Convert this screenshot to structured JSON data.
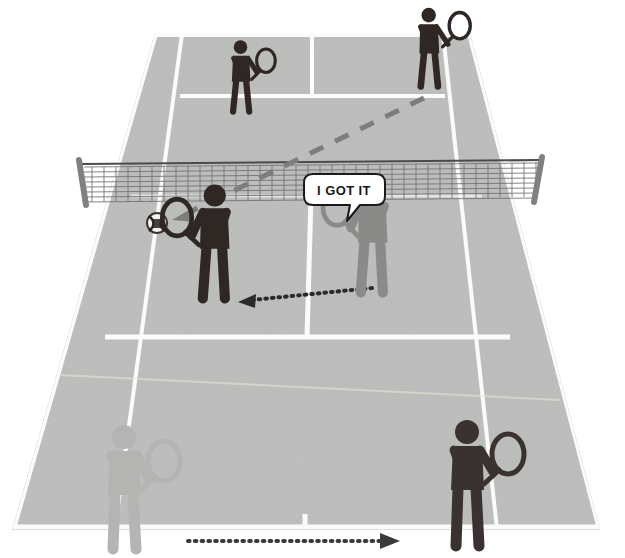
{
  "diagram": {
    "surface_color": "#c0c2c0",
    "line_color": "#fdfdfd",
    "net_color": "#6e6e6e",
    "dark_player_color": "#2e2724",
    "gray_player_color": "#8a8a88",
    "faded_player_color": "#b4b5b2",
    "arrow_dark_color": "#2b2b2b",
    "arrow_gray_color": "#7d7d7b",
    "ball_color": "#241f1d"
  },
  "callout": {
    "text": "I GOT IT",
    "speaker": "near-right-gray-player",
    "bubble_fill": "#ffffff",
    "bubble_stroke": "#1a1a1a"
  },
  "players": [
    {
      "id": "far-left-player",
      "label": "Far court left player",
      "side": "far",
      "shade": "dark",
      "color": "#2e2724",
      "x": 243,
      "y": 88,
      "scale": 0.62,
      "racket_side": "right"
    },
    {
      "id": "far-right-player",
      "label": "Far court right player (hitter)",
      "side": "far",
      "shade": "dark",
      "color": "#2e2724",
      "x": 432,
      "y": 60,
      "scale": 0.66,
      "racket_side": "right"
    },
    {
      "id": "near-left-player",
      "label": "Near court left player",
      "side": "near",
      "shade": "dark",
      "color": "#2e2724",
      "x": 212,
      "y": 258,
      "scale": 0.92,
      "racket_side": "left"
    },
    {
      "id": "near-right-player",
      "label": "Near court right player (calling)",
      "side": "near",
      "shade": "gray",
      "color": "#8a8a88",
      "x": 370,
      "y": 252,
      "scale": 0.92,
      "racket_side": "left"
    },
    {
      "id": "bottom-left-player",
      "label": "Bottom left faded player",
      "side": "bottom",
      "shade": "faded",
      "color": "#b4b5b2",
      "x": 127,
      "y": 505,
      "scale": 1.0,
      "racket_side": "right"
    },
    {
      "id": "bottom-right-player",
      "label": "Bottom right player",
      "side": "bottom",
      "shade": "dark",
      "color": "#3a3230",
      "x": 470,
      "y": 500,
      "scale": 1.0,
      "racket_side": "right"
    }
  ],
  "ball": {
    "label": "tennis-ball",
    "x": 157,
    "y": 223,
    "radius": 10
  },
  "arrows": [
    {
      "id": "ball-trajectory-arrow",
      "label": "Ball flight path from far right player to near left court",
      "style": "dashed",
      "color": "#7d7d7b",
      "from_x": 424,
      "from_y": 98,
      "to_x": 176,
      "to_y": 218
    },
    {
      "id": "player-movement-arrow",
      "label": "Near right player moving left toward ball",
      "style": "dotted",
      "color": "#2b2b2b",
      "from_x": 372,
      "from_y": 288,
      "to_x": 240,
      "to_y": 302
    },
    {
      "id": "bottom-movement-arrow",
      "label": "Bottom court movement to the right",
      "style": "dotted",
      "color": "#3a3a3a",
      "from_x": 188,
      "from_y": 541,
      "to_x": 398,
      "to_y": 541
    }
  ],
  "net": {
    "label": "tennis-net",
    "left_post_x": 80,
    "right_post_x": 541,
    "top_y": 163,
    "bottom_y": 203,
    "cord_color": "#4f4f4f"
  },
  "court_lines": {
    "far_baseline_y": 33,
    "far_service_line_y": 97,
    "net_line_y": 196,
    "near_service_line_y": 338,
    "near_baseline_y": 528,
    "labels": [
      "far-baseline",
      "far-service-line",
      "far-center-service-line",
      "far-left-doubles-alley",
      "far-right-doubles-alley",
      "near-service-line",
      "near-center-service-line",
      "near-left-doubles-alley",
      "near-right-doubles-alley",
      "near-baseline",
      "center-mark"
    ]
  }
}
